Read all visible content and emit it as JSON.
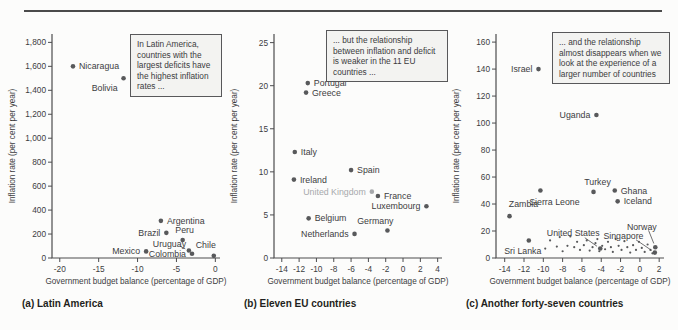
{
  "figure": {
    "top_rule_color": "#4b4b4b",
    "background": "#fcfcfb"
  },
  "colors": {
    "dot": "#58595b",
    "muted": "#a7a9ac",
    "axis": "#4c4c4e",
    "text": "#3d3d3f"
  },
  "chart_data": [
    {
      "id": "a",
      "type": "scatter",
      "caption": "(a) Latin America",
      "xlabel": "Government budget balance (percentage of GDP)",
      "ylabel": "Inflation rate (per cent per year)",
      "xlim": [
        -21,
        0.6
      ],
      "ylim": [
        0,
        1870
      ],
      "grid": false,
      "xticks": [
        {
          "v": -20,
          "t": "-20"
        },
        {
          "v": -15,
          "t": "-15"
        },
        {
          "v": -10,
          "t": "-10"
        },
        {
          "v": -5,
          "t": "-5"
        },
        {
          "v": 0,
          "t": "0"
        }
      ],
      "yticks": [
        {
          "v": 0,
          "t": "0"
        },
        {
          "v": 200,
          "t": "200"
        },
        {
          "v": 400,
          "t": "400"
        },
        {
          "v": 600,
          "t": "600"
        },
        {
          "v": 800,
          "t": "800"
        },
        {
          "v": 1000,
          "t": "1,000"
        },
        {
          "v": 1200,
          "t": "1,200"
        },
        {
          "v": 1400,
          "t": "1,400"
        },
        {
          "v": 1600,
          "t": "1,600"
        },
        {
          "v": 1800,
          "t": "1,800"
        }
      ],
      "annotation": {
        "text": "In Latin America, countries with the largest deficits have the highest inflation rates ...",
        "position": "top-right"
      },
      "points": [
        {
          "name": "Nicaragua",
          "x": -18.3,
          "y": 1600,
          "label": "right"
        },
        {
          "name": "Bolivia",
          "x": -11.8,
          "y": 1500,
          "label": "offset",
          "dx": -6,
          "dy": 13,
          "anchor": "end"
        },
        {
          "name": "Argentina",
          "x": -7.0,
          "y": 310,
          "label": "right"
        },
        {
          "name": "Brazil",
          "x": -6.3,
          "y": 210,
          "label": "left"
        },
        {
          "name": "Peru",
          "x": -4.2,
          "y": 150,
          "label": "offset",
          "dx": 2,
          "dy": -7,
          "anchor": "middle"
        },
        {
          "name": "Uruguay",
          "x": -3.4,
          "y": 62,
          "label": "leader",
          "lx": -5.9,
          "ly": 118,
          "anchor": "middle",
          "leader_from": [
            -4.6,
            100
          ]
        },
        {
          "name": "Mexico",
          "x": -8.9,
          "y": 55,
          "label": "left"
        },
        {
          "name": "Colombia",
          "x": -3.0,
          "y": 35,
          "label": "left"
        },
        {
          "name": "Chile",
          "x": -0.2,
          "y": 18,
          "label": "offset",
          "dx": -8,
          "dy": -8,
          "anchor": "middle"
        }
      ],
      "small_points": []
    },
    {
      "id": "b",
      "type": "scatter",
      "caption": "(b) Eleven EU countries",
      "xlabel": "Government budget balance (percentage of GDP)",
      "ylabel": "Inflation rate (per cent per year)",
      "xlim": [
        -14.9,
        4.5
      ],
      "ylim": [
        0,
        26
      ],
      "grid": false,
      "xticks": [
        {
          "v": -14,
          "t": "-14"
        },
        {
          "v": -12,
          "t": "-12"
        },
        {
          "v": -10,
          "t": "-10"
        },
        {
          "v": -8,
          "t": "-8"
        },
        {
          "v": -6,
          "t": "-6"
        },
        {
          "v": -4,
          "t": "-4"
        },
        {
          "v": -2,
          "t": "-2"
        },
        {
          "v": 0,
          "t": "0"
        },
        {
          "v": 2,
          "t": "2"
        },
        {
          "v": 4,
          "t": "4"
        }
      ],
      "yticks": [
        {
          "v": 0,
          "t": "0"
        },
        {
          "v": 5,
          "t": "5"
        },
        {
          "v": 10,
          "t": "10"
        },
        {
          "v": 15,
          "t": "15"
        },
        {
          "v": 20,
          "t": "20"
        },
        {
          "v": 25,
          "t": "25"
        }
      ],
      "annotation": {
        "text": "... but the relationship between inflation and deficit is weaker in the 11 EU countries ...",
        "position": "top-right"
      },
      "points": [
        {
          "name": "Portugal",
          "x": -11.0,
          "y": 20.3,
          "label": "right"
        },
        {
          "name": "Greece",
          "x": -11.2,
          "y": 19.2,
          "label": "right"
        },
        {
          "name": "Italy",
          "x": -12.5,
          "y": 12.3,
          "label": "right"
        },
        {
          "name": "Spain",
          "x": -6.0,
          "y": 10.2,
          "label": "right"
        },
        {
          "name": "Ireland",
          "x": -12.6,
          "y": 9.1,
          "label": "right"
        },
        {
          "name": "United Kingdom",
          "x": -3.6,
          "y": 7.7,
          "label": "left",
          "muted": true
        },
        {
          "name": "France",
          "x": -2.9,
          "y": 7.2,
          "label": "right"
        },
        {
          "name": "Luxembourg",
          "x": 2.7,
          "y": 6.0,
          "label": "left"
        },
        {
          "name": "Belgium",
          "x": -10.9,
          "y": 4.6,
          "label": "right"
        },
        {
          "name": "Germany",
          "x": -1.8,
          "y": 3.2,
          "label": "offset",
          "dx": 6,
          "dy": -6,
          "anchor": "end"
        },
        {
          "name": "Netherlands",
          "x": -5.6,
          "y": 2.8,
          "label": "left"
        }
      ],
      "small_points": []
    },
    {
      "id": "c",
      "type": "scatter",
      "caption": "(c) Another forty-seven countries",
      "xlabel": "Government budget balance (percentage of GDP)",
      "ylabel": "Inflation rate (per cent per year)",
      "xlim": [
        -14.9,
        2.5
      ],
      "ylim": [
        0,
        166
      ],
      "grid": false,
      "xticks": [
        {
          "v": -14,
          "t": "-14"
        },
        {
          "v": -12,
          "t": "-12"
        },
        {
          "v": -10,
          "t": "-10"
        },
        {
          "v": -8,
          "t": "-8"
        },
        {
          "v": -6,
          "t": "-6"
        },
        {
          "v": -4,
          "t": "-4"
        },
        {
          "v": -2,
          "t": "-2"
        },
        {
          "v": 0,
          "t": "0"
        },
        {
          "v": 2,
          "t": "2"
        }
      ],
      "yticks": [
        {
          "v": 0,
          "t": "0"
        },
        {
          "v": 20,
          "t": "20"
        },
        {
          "v": 40,
          "t": "40"
        },
        {
          "v": 60,
          "t": "60"
        },
        {
          "v": 80,
          "t": "80"
        },
        {
          "v": 100,
          "t": "100"
        },
        {
          "v": 120,
          "t": "120"
        },
        {
          "v": 140,
          "t": "140"
        },
        {
          "v": 160,
          "t": "160"
        }
      ],
      "annotation": {
        "text": "... and the relationship almost disappears when we look at the experience of a larger number of countries",
        "position": "top-right"
      },
      "points": [
        {
          "name": "Israel",
          "x": -10.5,
          "y": 140,
          "label": "left"
        },
        {
          "name": "Uganda",
          "x": -4.5,
          "y": 106,
          "label": "left"
        },
        {
          "name": "Sierra Leone",
          "x": -10.3,
          "y": 50,
          "label": "offset",
          "dx": 14,
          "dy": 14,
          "anchor": "middle"
        },
        {
          "name": "Turkey",
          "x": -4.8,
          "y": 49,
          "label": "offset",
          "dx": 4,
          "dy": -7,
          "anchor": "middle"
        },
        {
          "name": "Ghana",
          "x": -2.6,
          "y": 50,
          "label": "right"
        },
        {
          "name": "Iceland",
          "x": -2.3,
          "y": 42,
          "label": "right"
        },
        {
          "name": "Zambia",
          "x": -13.5,
          "y": 31,
          "label": "offset",
          "dx": 14,
          "dy": -9,
          "anchor": "middle"
        },
        {
          "name": "Sri Lanka",
          "x": -11.5,
          "y": 13,
          "label": "offset",
          "dx": -6,
          "dy": 14,
          "anchor": "middle"
        },
        {
          "name": "United States",
          "x": -4.1,
          "y": 7,
          "label": "leader",
          "lx": -6.9,
          "ly": 18.5,
          "anchor": "middle",
          "leader_from": [
            -5.7,
            15
          ]
        },
        {
          "name": "Norway",
          "x": 1.6,
          "y": 8,
          "label": "leader",
          "lx": 0.2,
          "ly": 23,
          "anchor": "middle",
          "leader_from": [
            0.9,
            20.5
          ]
        },
        {
          "name": "Singapore",
          "x": 1.55,
          "y": 4,
          "label": "leader",
          "lx": -1.7,
          "ly": 16.5,
          "anchor": "middle",
          "leader_from": [
            -0.4,
            13.5
          ]
        }
      ],
      "small_points": [
        [
          -9.8,
          7
        ],
        [
          -9.3,
          13
        ],
        [
          -8.6,
          8.5
        ],
        [
          -8.3,
          15.5
        ],
        [
          -8.0,
          5
        ],
        [
          -7.5,
          9
        ],
        [
          -7.2,
          16
        ],
        [
          -6.8,
          8
        ],
        [
          -6.5,
          12
        ],
        [
          -6.2,
          6
        ],
        [
          -5.8,
          9.5
        ],
        [
          -5.5,
          13
        ],
        [
          -5.2,
          5.5
        ],
        [
          -4.9,
          8
        ],
        [
          -4.6,
          11
        ],
        [
          -4.4,
          14
        ],
        [
          -4.2,
          5
        ],
        [
          -3.9,
          9
        ],
        [
          -3.6,
          6.5
        ],
        [
          -3.3,
          12
        ],
        [
          -3.0,
          8
        ],
        [
          -2.8,
          4.5
        ],
        [
          -2.5,
          14
        ],
        [
          -2.2,
          9
        ],
        [
          -1.9,
          6
        ],
        [
          -1.6,
          12.5
        ],
        [
          -1.3,
          8
        ],
        [
          -1.0,
          4
        ],
        [
          -0.7,
          9.5
        ],
        [
          -0.4,
          6
        ],
        [
          -0.1,
          12
        ],
        [
          0.2,
          7.5
        ],
        [
          0.5,
          4.5
        ],
        [
          0.8,
          10
        ],
        [
          1.1,
          6
        ],
        [
          1.3,
          3.5
        ]
      ]
    }
  ]
}
